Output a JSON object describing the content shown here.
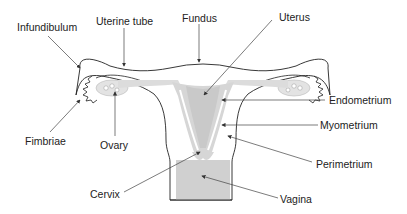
{
  "labels": {
    "infundibulum": "Infundibulum",
    "uterine_tube": "Uterine tube",
    "fundus": "Fundus",
    "uterus": "Uterus",
    "endometrium": "Endometrium",
    "myometrium": "Myometrium",
    "perimetrium": "Perimetrium",
    "fimbriae": "Fimbriae",
    "ovary": "Ovary",
    "cervix": "Cervix",
    "vagina": "Vagina"
  },
  "colors": {
    "outline": "#222222",
    "tissue_fill": "#d9d9d9",
    "cavity_fill": "#cfcfcf",
    "leader": "#444444"
  }
}
